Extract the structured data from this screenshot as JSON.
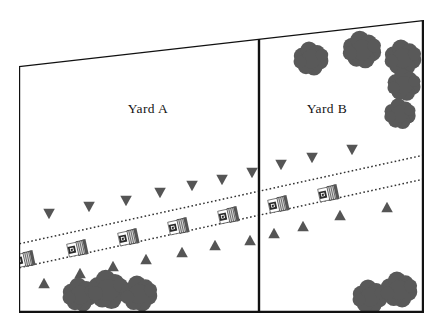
{
  "figure": {
    "title": "",
    "background_color": "#ffffff",
    "line_color": "#111111",
    "tree_color": "#595959",
    "marker_color": "#555555",
    "width": 438,
    "height": 331
  },
  "labels": {
    "yard_a": "Yard A",
    "yard_b": "Yard B"
  },
  "chart_data": {
    "type": "diagram",
    "title": "",
    "boundary": {
      "name": "site-boundary",
      "points": [
        [
          19,
          66
        ],
        [
          423,
          20
        ],
        [
          423,
          312
        ],
        [
          19,
          312
        ]
      ],
      "stroke": "#111111",
      "stroke_width": 2.4
    },
    "divider": {
      "name": "yard-divider-fence",
      "x1": 259,
      "y1": 38,
      "x2": 259,
      "y2": 312,
      "stroke": "#111111",
      "stroke_width": 2.4
    },
    "regions": [
      {
        "name": "Yard A",
        "label_x": 148,
        "label_y": 113
      },
      {
        "name": "Yard B",
        "label_x": 327,
        "label_y": 113
      }
    ],
    "road": {
      "name": "roadway",
      "style": "dotted-edges",
      "edge_color": "#333333",
      "upper_edge": {
        "x1": 0,
        "y1": 248,
        "x2": 438,
        "y2": 152
      },
      "lower_edge": {
        "x1": 0,
        "y1": 272,
        "x2": 438,
        "y2": 176
      },
      "angle_deg": -12.4
    },
    "vehicles": [
      {
        "x": 18,
        "y": 261
      },
      {
        "x": 71,
        "y": 250
      },
      {
        "x": 122,
        "y": 239
      },
      {
        "x": 172,
        "y": 228
      },
      {
        "x": 222,
        "y": 217
      },
      {
        "x": 272,
        "y": 206
      },
      {
        "x": 322,
        "y": 195
      }
    ],
    "markers_above_road": [
      {
        "x": 49,
        "y": 214
      },
      {
        "x": 89,
        "y": 207
      },
      {
        "x": 126,
        "y": 201
      },
      {
        "x": 160,
        "y": 193
      },
      {
        "x": 192,
        "y": 186
      },
      {
        "x": 222,
        "y": 180
      },
      {
        "x": 252,
        "y": 173
      },
      {
        "x": 281,
        "y": 165
      },
      {
        "x": 312,
        "y": 158
      },
      {
        "x": 352,
        "y": 150
      }
    ],
    "markers_below_road": [
      {
        "x": 44,
        "y": 283
      },
      {
        "x": 80,
        "y": 273
      },
      {
        "x": 113,
        "y": 266
      },
      {
        "x": 146,
        "y": 259
      },
      {
        "x": 182,
        "y": 252
      },
      {
        "x": 215,
        "y": 245
      },
      {
        "x": 250,
        "y": 240
      },
      {
        "x": 274,
        "y": 233
      },
      {
        "x": 303,
        "y": 226
      },
      {
        "x": 340,
        "y": 215
      },
      {
        "x": 387,
        "y": 207
      }
    ],
    "tree_clusters": [
      {
        "name": "yard-b-top-left-tree",
        "cx": 311,
        "cy": 59,
        "scale": 1.0
      },
      {
        "name": "yard-b-top-mid-tree",
        "cx": 362,
        "cy": 50,
        "scale": 1.1
      },
      {
        "name": "yard-b-top-right-tree-a",
        "cx": 403,
        "cy": 58,
        "scale": 1.05
      },
      {
        "name": "yard-b-top-right-tree-b",
        "cx": 404,
        "cy": 85,
        "scale": 0.95
      },
      {
        "name": "yard-b-top-right-tree-c",
        "cx": 400,
        "cy": 114,
        "scale": 0.9
      },
      {
        "name": "yard-a-bottom-tree-a",
        "cx": 80,
        "cy": 295,
        "scale": 1.0
      },
      {
        "name": "yard-a-bottom-tree-b",
        "cx": 108,
        "cy": 290,
        "scale": 1.15
      },
      {
        "name": "yard-a-bottom-tree-c",
        "cx": 139,
        "cy": 294,
        "scale": 1.05
      },
      {
        "name": "yard-b-bottom-tree-a",
        "cx": 370,
        "cy": 297,
        "scale": 1.0
      },
      {
        "name": "yard-b-bottom-tree-b",
        "cx": 399,
        "cy": 290,
        "scale": 1.05
      }
    ]
  }
}
